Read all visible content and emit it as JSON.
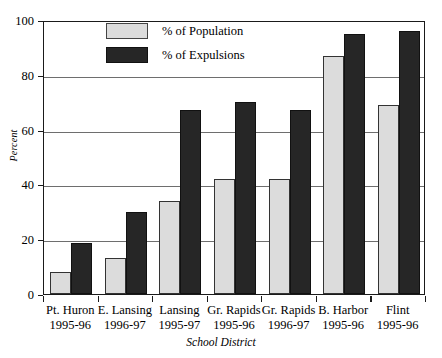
{
  "chart_data": {
    "type": "bar",
    "title": "",
    "xlabel": "School District",
    "ylabel": "Percent",
    "ylim": [
      0,
      100
    ],
    "yticks": [
      0,
      20,
      40,
      60,
      80,
      100
    ],
    "grid": true,
    "legend_position": "top-center",
    "categories": [
      "Pt. Huron 1995-96",
      "E. Lansing 1996-97",
      "Lansing 1995-97",
      "Gr. Rapids 1995-96",
      "Gr. Rapids 1996-97",
      "B. Harbor 1995-96",
      "Flint 1995-96"
    ],
    "category_lines": [
      {
        "line1": "Pt. Huron",
        "line2": "1995-96"
      },
      {
        "line1": "E. Lansing",
        "line2": "1996-97"
      },
      {
        "line1": "Lansing",
        "line2": "1995-97"
      },
      {
        "line1": "Gr. Rapids",
        "line2": "1995-96"
      },
      {
        "line1": "Gr. Rapids",
        "line2": "1996-97"
      },
      {
        "line1": "B. Harbor",
        "line2": "1995-96"
      },
      {
        "line1": "Flint",
        "line2": "1995-96"
      }
    ],
    "series": [
      {
        "name": "% of Population",
        "color": "#dcdcdc",
        "values": [
          8,
          13,
          34,
          42,
          42,
          87,
          69
        ]
      },
      {
        "name": "% of Expulsions",
        "color": "#262626",
        "values": [
          18.5,
          30,
          67,
          70,
          67,
          95,
          96
        ]
      }
    ]
  },
  "legend": {
    "items": [
      {
        "label": "% of Population",
        "swatch": "light"
      },
      {
        "label": "% of Expulsions",
        "swatch": "dark"
      }
    ]
  },
  "axes": {
    "y_title": "Percent",
    "x_title": "School District",
    "y_tick_labels": [
      "100",
      "80",
      "60",
      "40",
      "20",
      "0"
    ]
  }
}
